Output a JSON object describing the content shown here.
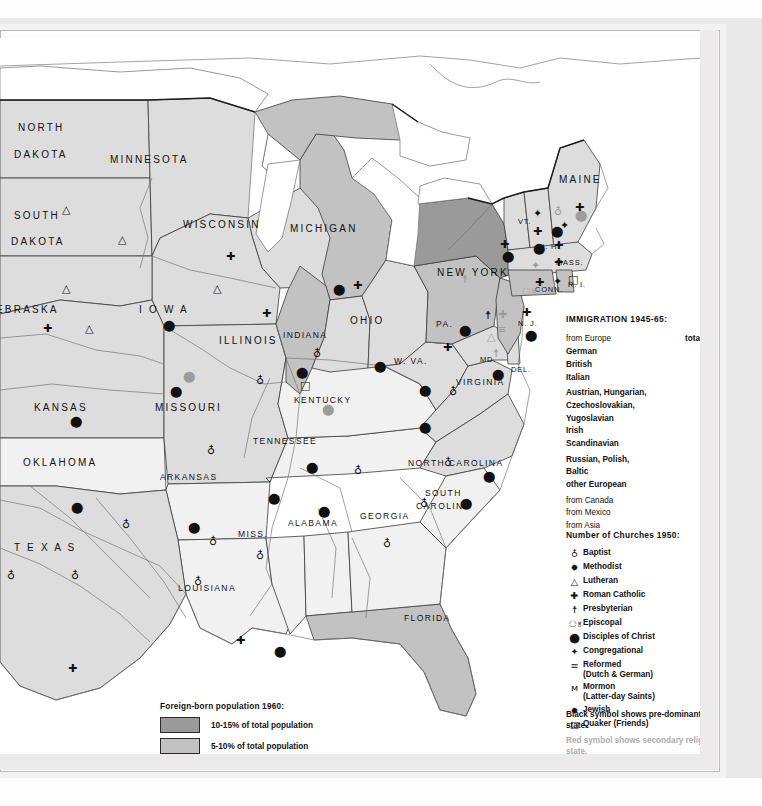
{
  "immigration": {
    "header": "IMMIGRATION 1945-65:",
    "rows": [
      {
        "label": "from Europe",
        "sub": "total",
        "value": "2,332,676",
        "indent": 0,
        "group": false
      },
      {
        "label": "German",
        "value": "794,192",
        "indent": 2,
        "group": false
      },
      {
        "label": "British",
        "value": "397,541",
        "indent": 2,
        "group": false
      },
      {
        "label": "Italian",
        "value": "310,449",
        "indent": 2,
        "group": false
      },
      {
        "label": "Austrian, Hungarian,",
        "value": "",
        "indent": 2,
        "group": true
      },
      {
        "label": "Czechoslovakian,",
        "value": "",
        "indent": 2,
        "group": false
      },
      {
        "label": "Yugoslavian",
        "value": "161,370",
        "indent": 2,
        "group": false
      },
      {
        "label": "Irish",
        "value": "106,860",
        "indent": 2,
        "group": false
      },
      {
        "label": "Scandinavian",
        "value": "102,338",
        "indent": 2,
        "group": false
      },
      {
        "label": "Russian, Polish,",
        "value": "",
        "indent": 2,
        "group": true
      },
      {
        "label": "Baltic",
        "value": "54,392",
        "indent": 2,
        "group": false
      },
      {
        "label": "other European",
        "value": "405,534",
        "indent": 2,
        "group": false
      },
      {
        "label": "from Canada",
        "value": "701,059",
        "indent": 0,
        "group": true
      },
      {
        "label": "from Mexico",
        "value": "532,143",
        "indent": 0,
        "group": false
      },
      {
        "label": "from Asia",
        "value": "260,572",
        "indent": 0,
        "group": false
      }
    ]
  },
  "churches": {
    "header": "Number of Churches 1950:",
    "rows": [
      {
        "glyph": "♁",
        "name": "Baptist",
        "value": "77,000"
      },
      {
        "glyph": "✹",
        "name": "Methodist",
        "value": "54,000"
      },
      {
        "glyph": "△",
        "name": "Lutheran",
        "value": "16,403"
      },
      {
        "glyph": "✚",
        "name": "Roman Catholic",
        "value": "15,533"
      },
      {
        "glyph": "☨",
        "name": "Presbyterian",
        "value": "13,200"
      },
      {
        "glyph": "ঃ",
        "name": "Episcopal",
        "value": "7,784"
      },
      {
        "glyph": "⬤",
        "name": "Disciples of Christ",
        "value": "7,769"
      },
      {
        "glyph": "✦",
        "name": "Congregational",
        "value": "5,679"
      },
      {
        "glyph": "≡",
        "name": "Reformed",
        "name2": "(Dutch & German)",
        "value": "3,517"
      },
      {
        "glyph": "ᴍ",
        "name": "Mormon",
        "name2": "(Latter-day Saints)",
        "value": "2,693"
      },
      {
        "glyph": "✹",
        "name": "Jewish",
        "value": "2,000"
      },
      {
        "glyph": "□",
        "name": "Quaker (Friends)",
        "value": "654"
      }
    ]
  },
  "symbol_note": {
    "black": "Black symbol shows pre-dominant religion in state.",
    "red": "Red symbol shows secondary religion in state."
  },
  "foreign_born": {
    "header": "Foreign-born population 1960:",
    "classes": [
      {
        "label": "10-15% of total population",
        "color": "#9a9a9a"
      },
      {
        "label": "5-10% of total population",
        "color": "#c2c2c2"
      },
      {
        "label": "1-5% of total population",
        "color": "#dddddd"
      },
      {
        "label": "less than 1% of total population",
        "color": "#f1f1f1"
      }
    ]
  },
  "state_labels": [
    {
      "text": "NORTH",
      "x": 18,
      "y": 84,
      "size": "n"
    },
    {
      "text": "DAKOTA",
      "x": 14,
      "y": 111,
      "size": "n"
    },
    {
      "text": "SOUTH",
      "x": 14,
      "y": 172,
      "size": "n"
    },
    {
      "text": "DAKOTA",
      "x": 11,
      "y": 198,
      "size": "n"
    },
    {
      "text": "MINNESOTA",
      "x": 110,
      "y": 116,
      "size": "n"
    },
    {
      "text": "WISCONSIN",
      "x": 183,
      "y": 181,
      "size": "n"
    },
    {
      "text": "EBRASKA",
      "x": -4,
      "y": 266,
      "size": "n"
    },
    {
      "text": "I O W A",
      "x": 139,
      "y": 266,
      "size": "n"
    },
    {
      "text": "ILLINOIS",
      "x": 219,
      "y": 297,
      "size": "n"
    },
    {
      "text": "INDIANA",
      "x": 283,
      "y": 292,
      "size": "sm"
    },
    {
      "text": "OHIO",
      "x": 350,
      "y": 277,
      "size": "n"
    },
    {
      "text": "KANSAS",
      "x": 34,
      "y": 364,
      "size": "n"
    },
    {
      "text": "MISSOURI",
      "x": 155,
      "y": 364,
      "size": "n"
    },
    {
      "text": "OKLAHOMA",
      "x": 23,
      "y": 419,
      "size": "n"
    },
    {
      "text": "ARKANSAS",
      "x": 160,
      "y": 434,
      "size": "sm"
    },
    {
      "text": "T E X A S",
      "x": 14,
      "y": 504,
      "size": "n"
    },
    {
      "text": "LOUISIANA",
      "x": 178,
      "y": 545,
      "size": "sm"
    },
    {
      "text": "MISS.",
      "x": 238,
      "y": 491,
      "size": "sm"
    },
    {
      "text": "ALABAMA",
      "x": 288,
      "y": 480,
      "size": "sm"
    },
    {
      "text": "GEORGIA",
      "x": 360,
      "y": 473,
      "size": "sm"
    },
    {
      "text": "TENNESSEE",
      "x": 253,
      "y": 398,
      "size": "sm"
    },
    {
      "text": "KENTUCKY",
      "x": 294,
      "y": 357,
      "size": "sm"
    },
    {
      "text": "W. VA.",
      "x": 394,
      "y": 318,
      "size": "sm"
    },
    {
      "text": "VIRGINIA",
      "x": 456,
      "y": 339,
      "size": "sm"
    },
    {
      "text": "NORTH CAROLINA",
      "x": 408,
      "y": 420,
      "size": "sm"
    },
    {
      "text": "SOUTH",
      "x": 425,
      "y": 450,
      "size": "sm"
    },
    {
      "text": "CAROLINA",
      "x": 416,
      "y": 463,
      "size": "sm"
    },
    {
      "text": "FLORIDA",
      "x": 404,
      "y": 575,
      "size": "sm"
    },
    {
      "text": "PA.",
      "x": 436,
      "y": 281,
      "size": "sm"
    },
    {
      "text": "MD.",
      "x": 480,
      "y": 317,
      "size": "tiny"
    },
    {
      "text": "DEL.",
      "x": 511,
      "y": 327,
      "size": "tiny"
    },
    {
      "text": "N. J.",
      "x": 518,
      "y": 281,
      "size": "tiny"
    },
    {
      "text": "NEW  YORK",
      "x": 437,
      "y": 229,
      "size": "n"
    },
    {
      "text": "VT.",
      "x": 518,
      "y": 179,
      "size": "tiny"
    },
    {
      "text": "N. H.",
      "x": 539,
      "y": 204,
      "size": "tiny"
    },
    {
      "text": "MAINE",
      "x": 559,
      "y": 136,
      "size": "n"
    },
    {
      "text": "MASS.",
      "x": 556,
      "y": 220,
      "size": "tiny"
    },
    {
      "text": "CONN.",
      "x": 535,
      "y": 247,
      "size": "tiny"
    },
    {
      "text": "R. I.",
      "x": 568,
      "y": 242,
      "size": "tiny"
    },
    {
      "text": "MICHIGAN",
      "x": 290,
      "y": 185,
      "size": "n"
    }
  ],
  "map_symbols": [
    {
      "g": "△",
      "x": 62,
      "y": 166,
      "s": "primary"
    },
    {
      "g": "△",
      "x": 62,
      "y": 245,
      "s": "primary"
    },
    {
      "g": "△",
      "x": 118,
      "y": 196,
      "s": "primary"
    },
    {
      "g": "△",
      "x": 213,
      "y": 245,
      "s": "primary"
    },
    {
      "g": "✚",
      "x": 226,
      "y": 213,
      "s": "primary"
    },
    {
      "g": "✚",
      "x": 262,
      "y": 270,
      "s": "primary"
    },
    {
      "g": "✚",
      "x": 43,
      "y": 285,
      "s": "primary"
    },
    {
      "g": "△",
      "x": 85,
      "y": 285,
      "s": "primary"
    },
    {
      "g": "⬤",
      "x": 163,
      "y": 282,
      "s": "primary"
    },
    {
      "g": "⬤",
      "x": 170,
      "y": 348,
      "s": "primary"
    },
    {
      "g": "⬤",
      "x": 183,
      "y": 333,
      "s": "secondary"
    },
    {
      "g": "⬤",
      "x": 70,
      "y": 378,
      "s": "primary"
    },
    {
      "g": "♁",
      "x": 207,
      "y": 407,
      "s": "primary"
    },
    {
      "g": "♁",
      "x": 256,
      "y": 337,
      "s": "primary"
    },
    {
      "g": "⬤",
      "x": 71,
      "y": 464,
      "s": "primary"
    },
    {
      "g": "♁",
      "x": 122,
      "y": 481,
      "s": "primary"
    },
    {
      "g": "⬤",
      "x": 188,
      "y": 484,
      "s": "primary"
    },
    {
      "g": "♁",
      "x": 209,
      "y": 498,
      "s": "primary"
    },
    {
      "g": "♁",
      "x": 194,
      "y": 538,
      "s": "primary"
    },
    {
      "g": "♁",
      "x": 256,
      "y": 512,
      "s": "primary"
    },
    {
      "g": "⬤",
      "x": 268,
      "y": 455,
      "s": "primary"
    },
    {
      "g": "♁",
      "x": 7,
      "y": 532,
      "s": "primary"
    },
    {
      "g": "♁",
      "x": 71,
      "y": 532,
      "s": "primary"
    },
    {
      "g": "✚",
      "x": 68,
      "y": 625,
      "s": "primary"
    },
    {
      "g": "✚",
      "x": 236,
      "y": 597,
      "s": "primary"
    },
    {
      "g": "⬤",
      "x": 274,
      "y": 608,
      "s": "primary"
    },
    {
      "g": "⬤",
      "x": 306,
      "y": 424,
      "s": "primary"
    },
    {
      "g": "♁",
      "x": 354,
      "y": 427,
      "s": "primary"
    },
    {
      "g": "⬤",
      "x": 318,
      "y": 468,
      "s": "primary"
    },
    {
      "g": "♁",
      "x": 383,
      "y": 500,
      "s": "primary"
    },
    {
      "g": "♁",
      "x": 444,
      "y": 419,
      "s": "primary"
    },
    {
      "g": "⬤",
      "x": 483,
      "y": 433,
      "s": "primary"
    },
    {
      "g": "♁",
      "x": 420,
      "y": 460,
      "s": "primary"
    },
    {
      "g": "⬤",
      "x": 460,
      "y": 460,
      "s": "primary"
    },
    {
      "g": "⬤",
      "x": 419,
      "y": 384,
      "s": "primary"
    },
    {
      "g": "♁",
      "x": 313,
      "y": 310,
      "s": "primary"
    },
    {
      "g": "⬤",
      "x": 333,
      "y": 246,
      "s": "primary"
    },
    {
      "g": "✚",
      "x": 353,
      "y": 242,
      "s": "primary"
    },
    {
      "g": "⬤",
      "x": 296,
      "y": 329,
      "s": "primary"
    },
    {
      "g": "□",
      "x": 300,
      "y": 342,
      "s": "primary"
    },
    {
      "g": "⬤",
      "x": 374,
      "y": 323,
      "s": "primary"
    },
    {
      "g": "⬤",
      "x": 322,
      "y": 366,
      "s": "secondary"
    },
    {
      "g": "⬤",
      "x": 419,
      "y": 347,
      "s": "primary"
    },
    {
      "g": "♁",
      "x": 449,
      "y": 348,
      "s": "primary"
    },
    {
      "g": "⬤",
      "x": 459,
      "y": 287,
      "s": "primary"
    },
    {
      "g": "☨",
      "x": 485,
      "y": 272,
      "s": "primary"
    },
    {
      "g": "≡",
      "x": 497,
      "y": 286,
      "s": "secondary"
    },
    {
      "g": "✚",
      "x": 443,
      "y": 304,
      "s": "primary"
    },
    {
      "g": "△",
      "x": 487,
      "y": 293,
      "s": "secondary"
    },
    {
      "g": "⬤",
      "x": 492,
      "y": 331,
      "s": "primary"
    },
    {
      "g": "☨",
      "x": 493,
      "y": 310,
      "s": "secondary"
    },
    {
      "g": "✚",
      "x": 522,
      "y": 269,
      "s": "primary"
    },
    {
      "g": "⬤",
      "x": 525,
      "y": 292,
      "s": "primary"
    },
    {
      "g": "✚",
      "x": 498,
      "y": 271,
      "s": "secondary"
    },
    {
      "g": "✚",
      "x": 500,
      "y": 201,
      "s": "primary"
    },
    {
      "g": "☨",
      "x": 462,
      "y": 236,
      "s": "secondary"
    },
    {
      "g": "ঃ",
      "x": 490,
      "y": 221,
      "s": "secondary"
    },
    {
      "g": "⬤",
      "x": 502,
      "y": 213,
      "s": "primary"
    },
    {
      "g": "✦",
      "x": 533,
      "y": 170,
      "s": "primary"
    },
    {
      "g": "♁",
      "x": 554,
      "y": 168,
      "s": "secondary"
    },
    {
      "g": "✚",
      "x": 533,
      "y": 188,
      "s": "primary"
    },
    {
      "g": "⬤",
      "x": 551,
      "y": 188,
      "s": "primary"
    },
    {
      "g": "✦",
      "x": 560,
      "y": 182,
      "s": "primary"
    },
    {
      "g": "⬤",
      "x": 533,
      "y": 205,
      "s": "primary"
    },
    {
      "g": "✚",
      "x": 554,
      "y": 202,
      "s": "primary"
    },
    {
      "g": "✚",
      "x": 575,
      "y": 164,
      "s": "primary"
    },
    {
      "g": "⬤",
      "x": 575,
      "y": 172,
      "s": "secondary"
    },
    {
      "g": "✚",
      "x": 554,
      "y": 219,
      "s": "primary"
    },
    {
      "g": "✦",
      "x": 531,
      "y": 222,
      "s": "secondary"
    },
    {
      "g": "✚",
      "x": 535,
      "y": 239,
      "s": "primary"
    },
    {
      "g": "✦",
      "x": 553,
      "y": 238,
      "s": "primary"
    },
    {
      "g": "□",
      "x": 568,
      "y": 236,
      "s": "primary"
    },
    {
      "g": "ঃ",
      "x": 521,
      "y": 248,
      "s": "secondary"
    }
  ]
}
